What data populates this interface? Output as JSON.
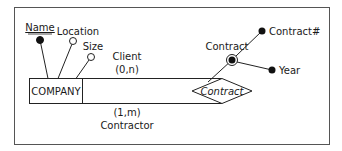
{
  "diagram": {
    "type": "entity-relationship",
    "entity": {
      "name": "COMPANY",
      "attributes": [
        {
          "name": "Name",
          "identifier": true
        },
        {
          "name": "Location",
          "identifier": false
        },
        {
          "name": "Size",
          "identifier": false
        }
      ]
    },
    "relationship": {
      "name": "Contract",
      "roles": [
        {
          "name": "Client",
          "cardinality": "(0,n)"
        },
        {
          "name": "Contractor",
          "cardinality": "(1,m)"
        }
      ],
      "composite_identifier": {
        "name": "Contract",
        "components": [
          {
            "name": "Contract#"
          },
          {
            "name": "Year"
          }
        ]
      }
    }
  }
}
